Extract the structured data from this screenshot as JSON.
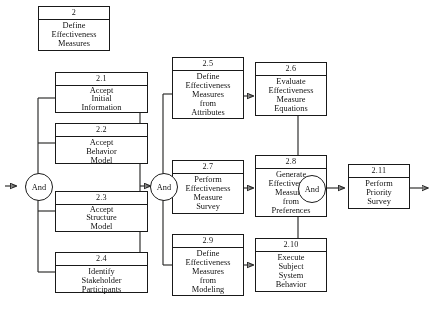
{
  "diagram": {
    "type": "process-flow",
    "title_box": {
      "id": "2",
      "lines": [
        "Define",
        "Effectiveness",
        "Measures"
      ]
    },
    "gates": [
      {
        "name": "and-gate-left",
        "label": "And"
      },
      {
        "name": "and-gate-middle",
        "label": "And"
      },
      {
        "name": "and-gate-right",
        "label": "And"
      }
    ],
    "nodes": [
      {
        "id": "2.1",
        "lines": [
          "Accept",
          "Initial",
          "Information"
        ]
      },
      {
        "id": "2.2",
        "lines": [
          "Accept",
          "Behavior",
          "Model"
        ]
      },
      {
        "id": "2.3",
        "lines": [
          "Accept",
          "Structure",
          "Model"
        ]
      },
      {
        "id": "2.4",
        "lines": [
          "Identify",
          "Stakeholder",
          "Participants"
        ]
      },
      {
        "id": "2.5",
        "lines": [
          "Define",
          "Effectiveness",
          "Measures",
          "from",
          "Attributes"
        ]
      },
      {
        "id": "2.6",
        "lines": [
          "Evaluate",
          "Effectiveness",
          "Measure",
          "Equations"
        ]
      },
      {
        "id": "2.7",
        "lines": [
          "Perform",
          "Effectiveness",
          "Measure",
          "Survey"
        ]
      },
      {
        "id": "2.8",
        "lines": [
          "Generate",
          "Effectiveness",
          "Measures",
          "from",
          "Preferences"
        ]
      },
      {
        "id": "2.9",
        "lines": [
          "Define",
          "Effectiveness",
          "Measures",
          "from",
          "Modeling"
        ]
      },
      {
        "id": "2.10",
        "lines": [
          "Execute",
          "Subject",
          "System",
          "Behavior"
        ]
      },
      {
        "id": "2.11",
        "lines": [
          "Perform",
          "Priority",
          "Survey"
        ]
      }
    ],
    "colors": {
      "stroke": "#1d1d1d",
      "background": "#fdfdfb",
      "box_fill": "#ffffff"
    }
  }
}
